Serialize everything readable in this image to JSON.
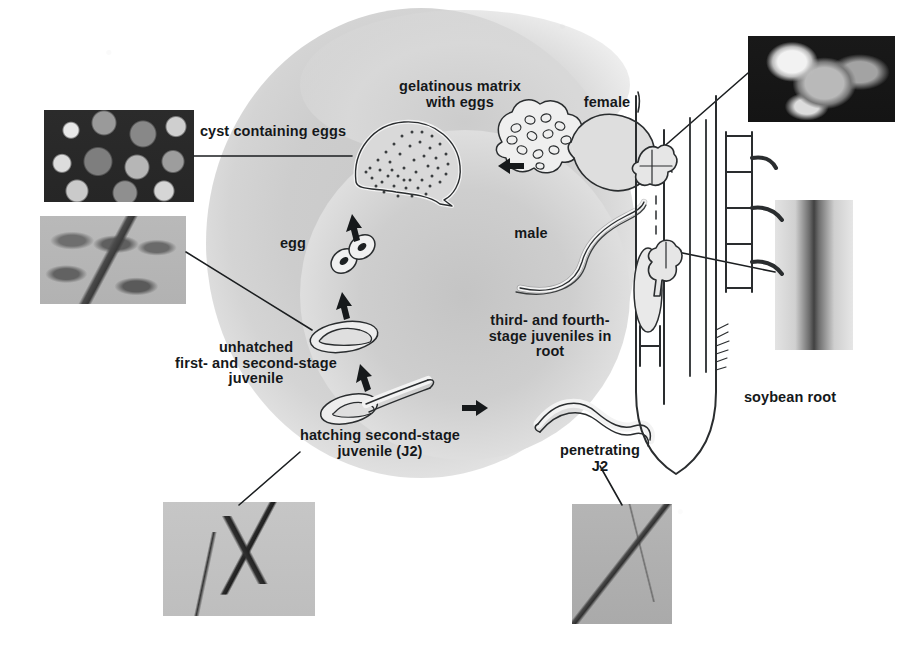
{
  "figure": {
    "background_color": "#ffffff",
    "blob_color": "#cdcdcd",
    "ink_color": "#15181a"
  },
  "labels": {
    "gelatinous_matrix": "gelatinous matrix\nwith eggs",
    "female": "female",
    "cyst_containing_eggs": "cyst containing eggs",
    "egg": "egg",
    "male": "male",
    "unhatched_juvenile": "unhatched\nfirst- and second-stage\njuvenile",
    "third_fourth_stage": "third- and fourth-\nstage juveniles in\nroot",
    "hatching_j2": "hatching second-stage\njuvenile (J2)",
    "penetrating_j2": "penetrating\nJ2",
    "soybean_root": "soybean root"
  },
  "photos": {
    "cysts": "cyst-photo",
    "eggs": "egg-photo",
    "female_on_root": "female-on-root-photo",
    "root_section": "root-section-photo",
    "juveniles": "juvenile-photo",
    "penetration": "penetration-photo"
  },
  "icons": {
    "arrow_left": "arrow-left-icon",
    "arrow_down_1": "arrow-down-icon",
    "arrow_down_2": "arrow-down-icon",
    "arrow_right": "arrow-right-icon"
  },
  "stages": {
    "cyst": "cyst-with-eggs-drawing",
    "egg_two_cell": "two-cell-egg-drawing",
    "unhatched": "unhatched-juvenile-drawing",
    "hatching": "hatching-j2-drawing",
    "penetrating": "penetrating-j2-drawing",
    "female_body": "female-nematode-drawing",
    "male_body": "male-nematode-drawing",
    "matrix": "gelatinous-matrix-drawing",
    "root": "soybean-root-drawing",
    "syncytium_upper": "syncytium-upper-drawing",
    "syncytium_lower": "syncytium-lower-drawing"
  }
}
